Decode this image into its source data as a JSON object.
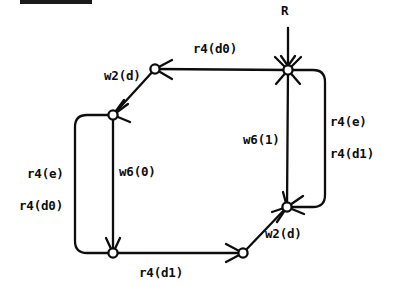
{
  "diagram": {
    "type": "directed-graph",
    "stroke_color": "#0d0d0d",
    "background_color": "#ffffff",
    "node_fill_color": "#ffffff",
    "entry_label": "R",
    "nodes": [
      {
        "id": "n_top_right",
        "name": "node-top-right",
        "x": 288,
        "y": 70
      },
      {
        "id": "n_top_left",
        "name": "node-top-left",
        "x": 155,
        "y": 69
      },
      {
        "id": "n_mid_left",
        "name": "node-mid-left",
        "x": 113,
        "y": 115
      },
      {
        "id": "n_bottom_left",
        "name": "node-bottom-left",
        "x": 113,
        "y": 253
      },
      {
        "id": "n_bottom_mid",
        "name": "node-bottom-mid",
        "x": 243,
        "y": 253
      },
      {
        "id": "n_bottom_right",
        "name": "node-bottom-right",
        "x": 287,
        "y": 207
      }
    ],
    "labels": [
      {
        "name": "label-entry-r",
        "text": "R",
        "x": 281,
        "y": 5
      },
      {
        "name": "label-r4-d0-top",
        "text": "r4(d0)",
        "x": 193,
        "y": 43
      },
      {
        "name": "label-w2-d-upper",
        "text": "w2(d)",
        "x": 104,
        "y": 70
      },
      {
        "name": "label-w6-1",
        "text": "w6(1)",
        "x": 243,
        "y": 134
      },
      {
        "name": "label-r4-e-right",
        "text": "r4(e)",
        "x": 330,
        "y": 116
      },
      {
        "name": "label-r4-d1-right",
        "text": "r4(d1)",
        "x": 330,
        "y": 148
      },
      {
        "name": "label-r4-e-left",
        "text": "r4(e)",
        "x": 27,
        "y": 168
      },
      {
        "name": "label-r4-d0-left",
        "text": "r4(d0)",
        "x": 19,
        "y": 200
      },
      {
        "name": "label-w6-0",
        "text": "w6(0)",
        "x": 119,
        "y": 166
      },
      {
        "name": "label-w2-d-lower",
        "text": "w2(d)",
        "x": 265,
        "y": 228
      },
      {
        "name": "label-r4-d1-bottom",
        "text": "r4(d1)",
        "x": 139,
        "y": 267
      }
    ],
    "artifacts": [
      {
        "name": "scan-artifact-bar",
        "x": 20,
        "y": 0,
        "width": 72,
        "height": 4
      }
    ]
  }
}
